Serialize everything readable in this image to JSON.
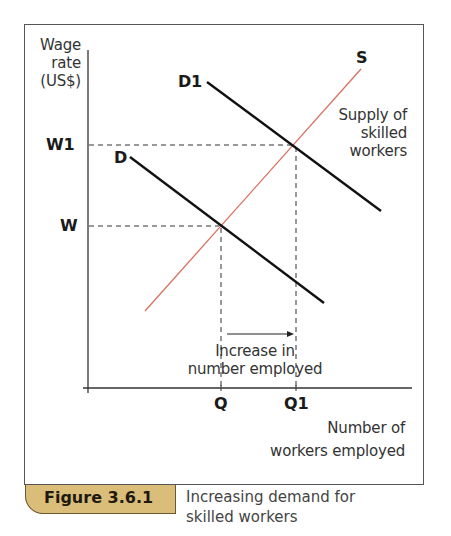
{
  "figure": {
    "number": "Figure 3.6.1",
    "caption_line1": "Increasing demand for",
    "caption_line2": "skilled workers",
    "tab_color": "#d9bd78"
  },
  "axes": {
    "y_label_line1": "Wage",
    "y_label_line2": "rate",
    "y_label_line3": "(US$)",
    "x_label_line1": "Number of",
    "x_label_line2": "workers employed",
    "y_ticks": [
      "W1",
      "W"
    ],
    "x_ticks": [
      "Q",
      "Q1"
    ]
  },
  "curves": {
    "supply_label": "S",
    "supply_desc_line1": "Supply of",
    "supply_desc_line2": "skilled",
    "supply_desc_line3": "workers",
    "demand_label": "D",
    "demand_new_label": "D1",
    "supply_color": "#d9705f",
    "demand_color": "#111111"
  },
  "annotation": {
    "line1": "Increase in",
    "line2": "number employed"
  },
  "diagram_data": {
    "type": "supply-demand",
    "equilibria": [
      {
        "name": "initial",
        "wage": "W",
        "quantity": "Q",
        "curves": [
          "D",
          "S"
        ]
      },
      {
        "name": "new",
        "wage": "W1",
        "quantity": "Q1",
        "curves": [
          "D1",
          "S"
        ]
      }
    ],
    "shift": "Demand shifts right from D to D1, raising wage from W to W1 and employment from Q to Q1"
  }
}
